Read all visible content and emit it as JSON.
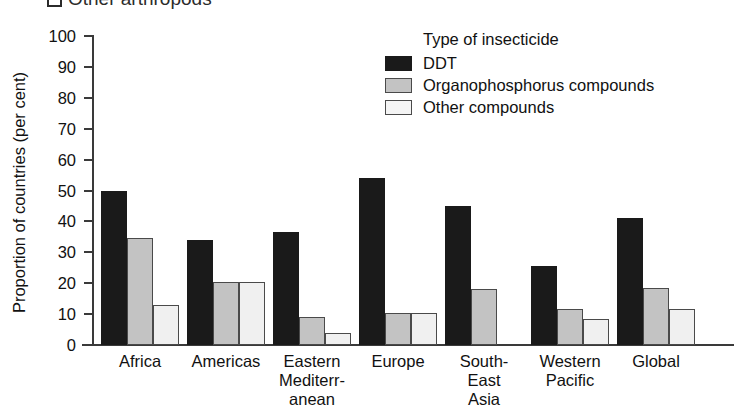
{
  "top_caption": {
    "text": "Other arthropods",
    "marker": "open-square-bullet"
  },
  "axes": {
    "ylabel": "Proportion of countries (per cent)",
    "yticks": [
      "100",
      "90",
      "80",
      "70",
      "60",
      "50",
      "40",
      "30",
      "20",
      "10",
      "0"
    ],
    "xlabel": ""
  },
  "legend": {
    "title": "Type of insecticide",
    "entries": [
      {
        "label": "DDT",
        "color": "#1a1a1a"
      },
      {
        "label": "Organophosphorus compounds",
        "color": "#c3c3c3"
      },
      {
        "label": "Other compounds",
        "color": "#f4f4f4"
      }
    ]
  },
  "xlabels": [
    [
      "Africa"
    ],
    [
      "Americas"
    ],
    [
      "Eastern",
      "Mediterr-",
      "anean"
    ],
    [
      "Europe"
    ],
    [
      "South-",
      "East",
      "Asia"
    ],
    [
      "Western",
      "Pacific"
    ],
    [
      "Global"
    ]
  ],
  "chart_data": {
    "type": "bar",
    "title": "Other arthropods",
    "xlabel": "",
    "ylabel": "Proportion of countries (per cent)",
    "ylim": [
      0,
      100
    ],
    "ytick_step": 10,
    "grid": false,
    "legend_position": "top-right",
    "legend_title": "Type of insecticide",
    "categories": [
      "Africa",
      "Americas",
      "Eastern Mediterranean",
      "Europe",
      "South-East Asia",
      "Western Pacific",
      "Global"
    ],
    "series": [
      {
        "name": "DDT",
        "color": "#1a1a1a",
        "values": [
          50,
          34,
          36.5,
          54,
          45,
          25.5,
          41
        ]
      },
      {
        "name": "Organophosphorus compounds",
        "color": "#c3c3c3",
        "values": [
          34.5,
          20.5,
          9,
          10.5,
          18,
          11.5,
          18.5
        ]
      },
      {
        "name": "Other compounds",
        "color": "#f0f0f0",
        "values": [
          13,
          20.5,
          4,
          10.5,
          0,
          8.5,
          11.5
        ]
      }
    ]
  },
  "layout": {
    "plot_left": 92,
    "plot_top": 36,
    "plot_height": 309,
    "group_start": 101,
    "group_pitch": 86,
    "bar_width": 26
  }
}
